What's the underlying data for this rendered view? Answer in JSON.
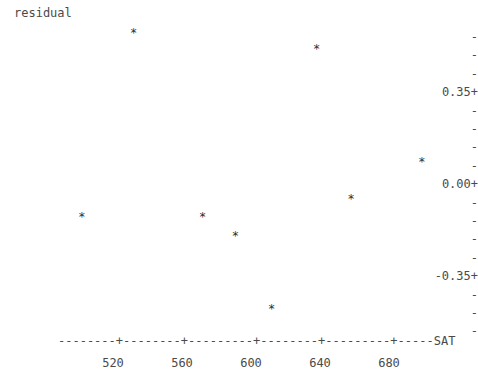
{
  "chart_data": {
    "type": "scatter",
    "title": "",
    "ylabel": "residual",
    "xlabel": "SAT",
    "xlim": [
      490,
      710
    ],
    "ylim": [
      -0.525,
      0.63
    ],
    "grid": false,
    "legend": null,
    "marker": "*",
    "x": [
      502,
      532,
      572,
      591,
      612,
      638,
      658,
      699
    ],
    "y": [
      -0.13,
      0.57,
      -0.13,
      -0.2,
      -0.48,
      0.51,
      -0.06,
      0.08
    ],
    "points": [
      {
        "x": 502,
        "y": -0.13
      },
      {
        "x": 532,
        "y": 0.57
      },
      {
        "x": 572,
        "y": -0.13
      },
      {
        "x": 591,
        "y": -0.2
      },
      {
        "x": 612,
        "y": -0.48
      },
      {
        "x": 638,
        "y": 0.51
      },
      {
        "x": 658,
        "y": -0.06
      },
      {
        "x": 699,
        "y": 0.08
      }
    ],
    "xticks": [
      520,
      560,
      600,
      640,
      680
    ],
    "xtick_labels": [
      "520",
      "560",
      "600",
      "640",
      "680"
    ],
    "yticks": [
      0.35,
      0.0,
      -0.35
    ],
    "ytick_labels": [
      "0.35+",
      "0.00+",
      "-0.35+"
    ],
    "y_minor_marker": "-",
    "axis_line": "-------+---------+---------+---------+---------+--------",
    "axis_end_label": "SAT"
  },
  "yaxis": {
    "title": "residual",
    "rows": [
      {
        "text": "-",
        "labeled": false
      },
      {
        "text": "-",
        "labeled": false
      },
      {
        "text": "-",
        "labeled": false
      },
      {
        "text": "0.35+",
        "labeled": true
      },
      {
        "text": "-",
        "labeled": false
      },
      {
        "text": "-",
        "labeled": false
      },
      {
        "text": "-",
        "labeled": false
      },
      {
        "text": "-",
        "labeled": false
      },
      {
        "text": "0.00+",
        "labeled": true
      },
      {
        "text": "-",
        "labeled": false
      },
      {
        "text": "-",
        "labeled": false
      },
      {
        "text": "-",
        "labeled": false
      },
      {
        "text": "-",
        "labeled": false
      },
      {
        "text": "-0.35+",
        "labeled": true
      },
      {
        "text": "-",
        "labeled": false
      },
      {
        "text": "-",
        "labeled": false
      },
      {
        "text": "-",
        "labeled": false
      }
    ]
  },
  "xaxis": {
    "line": "-------+---------+---------+---------+---------+--------",
    "end_label": "SAT",
    "ticks": [
      "520",
      "560",
      "600",
      "640",
      "680"
    ]
  },
  "colors": {
    "text": "#4a4a4a",
    "marker": "#2e2e2e",
    "background": "#ffffff"
  }
}
